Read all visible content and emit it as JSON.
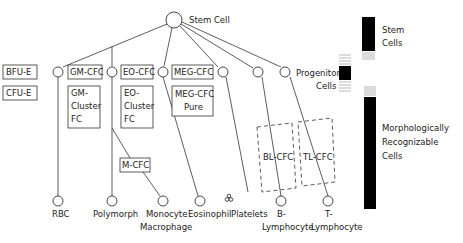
{
  "stem": {
    "label": "Stem Cell"
  },
  "progenitors": {
    "label_line1": "Progenitor",
    "label_line2": "Cells",
    "boxes_row1": [
      "BFU-E",
      "GM-CFC",
      "EO-CFC",
      "MEG-CFC"
    ],
    "boxes_row2": [
      {
        "lines": [
          "CFU-E"
        ]
      },
      {
        "lines": [
          "GM-",
          "Cluster",
          "FC"
        ]
      },
      {
        "lines": [
          "EO-",
          "Cluster",
          "FC"
        ]
      },
      {
        "lines": [
          "MEG-CFC",
          "Pure"
        ]
      }
    ],
    "intermediate": "M-CFC",
    "dashed_boxes": [
      "BL-CFC",
      "TL-CFC"
    ]
  },
  "mature_cells": [
    {
      "lines": [
        "RBC"
      ]
    },
    {
      "lines": [
        "Polymorph"
      ]
    },
    {
      "lines": [
        "Monocyte",
        "Macrophage"
      ]
    },
    {
      "lines": [
        "Eosinophil"
      ]
    },
    {
      "lines": [
        "Platelets"
      ]
    },
    {
      "lines": [
        "B-",
        "Lymphocyte"
      ]
    },
    {
      "lines": [
        "T-",
        "Lymphocyte"
      ]
    }
  ],
  "legend": [
    {
      "lines": [
        "Stem",
        "Cells"
      ]
    },
    {
      "lines": [
        "Morphologically",
        "Recognizable",
        "Cells"
      ]
    }
  ]
}
